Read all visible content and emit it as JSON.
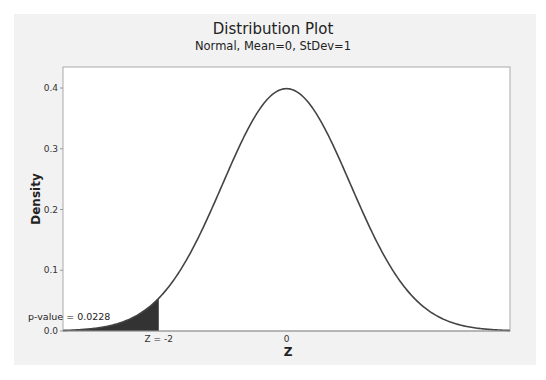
{
  "chart_data": {
    "type": "area",
    "title": "Distribution Plot",
    "subtitle": "Normal, Mean=0, StDev=1",
    "xlabel": "Z",
    "ylabel": "Density",
    "xlim": [
      -3.5,
      3.5
    ],
    "ylim": [
      0,
      0.42
    ],
    "x_ticks": [
      {
        "value": -2,
        "label": "Z = -2"
      },
      {
        "value": 0,
        "label": "0"
      }
    ],
    "y_ticks": [
      {
        "value": 0.0,
        "label": "0.0"
      },
      {
        "value": 0.1,
        "label": "0.1"
      },
      {
        "value": 0.2,
        "label": "0.2"
      },
      {
        "value": 0.3,
        "label": "0.3"
      },
      {
        "value": 0.4,
        "label": "0.4"
      }
    ],
    "grid": false,
    "series": [
      {
        "name": "Normal PDF",
        "distribution": "normal",
        "mean": 0,
        "stdev": 1,
        "peak_density": 0.399
      }
    ],
    "shaded_region": {
      "from": -3.5,
      "to": -2,
      "color": "#333333"
    },
    "annotations": [
      {
        "text": "p-value = 0.0228",
        "x": -3.4,
        "y": 0.06
      }
    ]
  },
  "colors": {
    "background": "#f2f2f2",
    "plot_area": "#ffffff",
    "curve": "#444444",
    "shade": "#333333",
    "frame": "#aaaaaa"
  }
}
